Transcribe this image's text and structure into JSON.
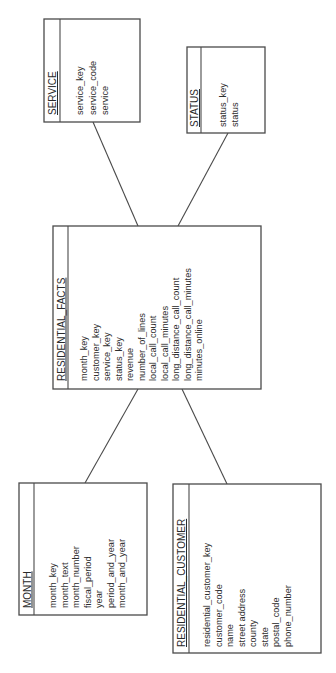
{
  "diagram": {
    "type": "star-schema",
    "orientation": "rotated-90-ccw",
    "colors": {
      "line": "#4a4a4a",
      "text": "#2e2e2e",
      "background": "#ffffff"
    }
  },
  "entities": {
    "service": {
      "title": "SERVICE",
      "fields": [
        "service_key",
        "service_code",
        "service"
      ]
    },
    "status": {
      "title": "STATUS",
      "fields": [
        "status_key",
        "status"
      ]
    },
    "residential_facts": {
      "title": "RESIDENTIAL_FACTS",
      "fields": [
        "month_key",
        "customer_key",
        "service_key",
        "status_key",
        "revenue",
        "number_of_lines",
        "local_call_count",
        "local_call_minutes",
        "long_distance_call_count",
        "long_distance_call_minutes",
        "minutes_online"
      ]
    },
    "month": {
      "title": "MONTH",
      "fields": [
        "month_key",
        "month_text",
        "month_number",
        "fiscal_period",
        "year",
        "period_and_year",
        "month_and_year"
      ]
    },
    "residential_customer": {
      "title": "RESIDENTIAL_CUSTOMER",
      "fields": [
        "residential_customer_key",
        "customer_code",
        "name",
        "street address",
        "county",
        "state",
        "postal_code",
        "phone_number"
      ]
    }
  },
  "relationships": [
    {
      "from": "SERVICE",
      "to": "RESIDENTIAL_FACTS"
    },
    {
      "from": "STATUS",
      "to": "RESIDENTIAL_FACTS"
    },
    {
      "from": "MONTH",
      "to": "RESIDENTIAL_FACTS"
    },
    {
      "from": "RESIDENTIAL_CUSTOMER",
      "to": "RESIDENTIAL_FACTS"
    }
  ]
}
